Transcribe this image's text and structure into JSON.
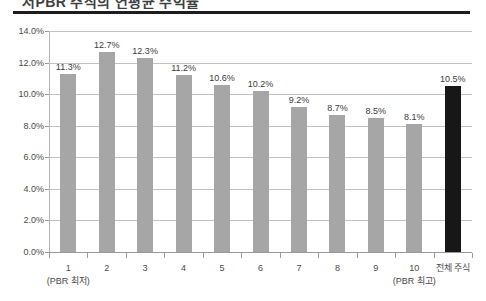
{
  "chart_data": {
    "type": "bar",
    "title": "저PBR 주식의 연평균 수익률",
    "xlabel": "",
    "ylabel": "",
    "ylim": [
      0,
      14
    ],
    "grid": true,
    "legend": "none",
    "categories": [
      "1",
      "2",
      "3",
      "4",
      "5",
      "6",
      "7",
      "8",
      "9",
      "10",
      "전체 주식"
    ],
    "category_sublabels": [
      "(PBR 최저)",
      "",
      "",
      "",
      "",
      "",
      "",
      "",
      "",
      "(PBR 최고)",
      ""
    ],
    "values": [
      11.3,
      12.7,
      12.3,
      11.2,
      10.6,
      10.2,
      9.2,
      8.7,
      8.5,
      8.1,
      10.5
    ],
    "data_labels": [
      "11.3%",
      "12.7%",
      "12.3%",
      "11.2%",
      "10.6%",
      "10.2%",
      "9.2%",
      "8.7%",
      "8.5%",
      "8.1%",
      "10.5%"
    ],
    "bar_colors": [
      "#a6a6a6",
      "#a6a6a6",
      "#a6a6a6",
      "#a6a6a6",
      "#a6a6a6",
      "#a6a6a6",
      "#a6a6a6",
      "#a6a6a6",
      "#a6a6a6",
      "#a6a6a6",
      "#171717"
    ],
    "highlight_index": 10,
    "ytick_labels": [
      "0.0%",
      "2.0%",
      "4.0%",
      "6.0%",
      "8.0%",
      "10.0%",
      "12.0%",
      "14.0%"
    ],
    "ytick_values": [
      0,
      2,
      4,
      6,
      8,
      10,
      12,
      14
    ],
    "colors": {
      "bar": "#a6a6a6",
      "highlight_bar": "#171717",
      "gridline": "#c2c2c2",
      "axis": "#9a9a9a",
      "rule": "#1d1d1d",
      "text": "#3a3a3a",
      "background": "#ffffff"
    }
  }
}
